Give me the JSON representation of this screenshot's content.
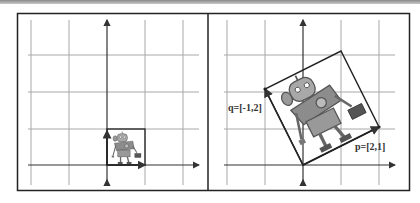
{
  "figure": {
    "left_panel": {
      "description": "Robot image in unit square before transformation",
      "basis": {
        "p": [
          1,
          0
        ],
        "q": [
          0,
          1
        ]
      }
    },
    "right_panel": {
      "description": "Robot image transformed by basis vectors",
      "labels": {
        "p": "p=[2,1]",
        "q": "q=[-1,2]"
      },
      "basis": {
        "p": [
          2,
          1
        ],
        "q": [
          -1,
          2
        ]
      }
    }
  },
  "colors": {
    "grid": "#a0a0a0",
    "axis": "#333333",
    "frame": "#222222",
    "robot_body": "#8c8c8c"
  }
}
